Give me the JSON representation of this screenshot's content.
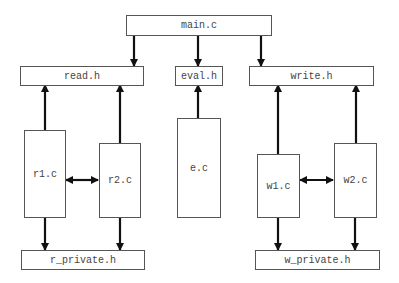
{
  "diagram": {
    "nodes": {
      "main_c": {
        "label": "main.c"
      },
      "read_h": {
        "label": "read.h"
      },
      "eval_h": {
        "label": "eval.h"
      },
      "write_h": {
        "label": "write.h"
      },
      "r1_c": {
        "label": "r1.c"
      },
      "r2_c": {
        "label": "r2.c"
      },
      "e_c": {
        "label": "e.c"
      },
      "w1_c": {
        "label": "w1.c"
      },
      "w2_c": {
        "label": "w2.c"
      },
      "r_private_h": {
        "label": "r_private.h"
      },
      "w_private_h": {
        "label": "w_private.h"
      }
    },
    "edges": [
      {
        "from": "main.c",
        "to": "read.h"
      },
      {
        "from": "main.c",
        "to": "eval.h"
      },
      {
        "from": "main.c",
        "to": "write.h"
      },
      {
        "from": "r1.c",
        "to": "read.h"
      },
      {
        "from": "r2.c",
        "to": "read.h"
      },
      {
        "from": "e.c",
        "to": "eval.h"
      },
      {
        "from": "w1.c",
        "to": "write.h"
      },
      {
        "from": "w2.c",
        "to": "write.h"
      },
      {
        "from": "r1.c",
        "to": "r2.c",
        "bidirectional": true
      },
      {
        "from": "w1.c",
        "to": "w2.c",
        "bidirectional": true
      },
      {
        "from": "r1.c",
        "to": "r_private.h"
      },
      {
        "from": "r2.c",
        "to": "r_private.h"
      },
      {
        "from": "w1.c",
        "to": "w_private.h"
      },
      {
        "from": "w2.c",
        "to": "w_private.h"
      }
    ]
  }
}
